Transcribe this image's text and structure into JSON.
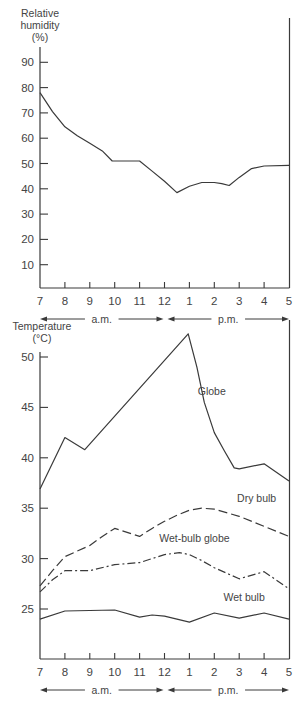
{
  "chart_data": [
    {
      "type": "line",
      "title": "",
      "ylabel": "Relative humidity (%)",
      "ylabel_lines": [
        "Relative",
        "humidity",
        "(%)"
      ],
      "xlabel": "",
      "ylim": [
        0,
        95
      ],
      "yticks": [
        10,
        20,
        30,
        40,
        50,
        60,
        70,
        80,
        90
      ],
      "x_tick_labels": [
        "7",
        "8",
        "9",
        "10",
        "11",
        "12",
        "1",
        "2",
        "3",
        "4",
        "5"
      ],
      "period_labels": [
        "a.m.",
        "p.m."
      ],
      "grid": false,
      "series": [
        {
          "name": "Relative humidity",
          "style": "solid",
          "x": [
            7,
            7.5,
            8,
            8.5,
            9,
            9.5,
            9.9,
            11,
            11.5,
            12,
            12.5,
            13,
            13.5,
            14,
            14.3,
            14.6,
            15,
            15.5,
            16,
            17
          ],
          "values": [
            78,
            70.5,
            64.5,
            61,
            58,
            55,
            51,
            51,
            47,
            43,
            38.5,
            41,
            42.5,
            42.5,
            42,
            41.3,
            44.5,
            48,
            49,
            49.3
          ]
        }
      ]
    },
    {
      "type": "line",
      "title": "",
      "ylabel": "Temperature (°C)",
      "ylabel_lines": [
        "Temperature",
        "(°C)"
      ],
      "xlabel": "",
      "ylim": [
        20,
        52.5
      ],
      "yticks": [
        25,
        30,
        35,
        40,
        45,
        50
      ],
      "x_tick_labels": [
        "7",
        "8",
        "9",
        "10",
        "11",
        "12",
        "1",
        "2",
        "3",
        "4",
        "5"
      ],
      "period_labels": [
        "a.m.",
        "p.m."
      ],
      "grid": false,
      "series": [
        {
          "name": "Globe",
          "style": "solid",
          "label_pos": {
            "x": 13.9,
            "y": 46.2
          },
          "x": [
            7,
            8,
            8.8,
            12.95,
            13.3,
            13.6,
            14,
            14.4,
            14.8,
            15,
            16,
            17
          ],
          "values": [
            36.9,
            42.0,
            40.8,
            52.3,
            49,
            45.5,
            42.5,
            40.7,
            39.0,
            38.9,
            39.4,
            37.7
          ]
        },
        {
          "name": "Dry bulb",
          "style": "dashed",
          "label_pos": {
            "x": 15.7,
            "y": 35.6
          },
          "x": [
            7,
            7.5,
            8,
            9,
            9.5,
            10,
            11,
            11.5,
            12,
            12.5,
            13,
            13.5,
            14,
            15,
            16,
            17
          ],
          "values": [
            27.3,
            28.8,
            30.2,
            31.3,
            32.2,
            33.0,
            32.2,
            33.0,
            33.7,
            34.3,
            34.8,
            35.0,
            34.9,
            34.2,
            33.2,
            32.2
          ],
          "marker": "none"
        },
        {
          "name": "Wet-bulb globe",
          "style": "dash-dot",
          "label_pos": {
            "x": 13.2,
            "y": 31.6
          },
          "x": [
            7,
            7.5,
            8,
            9,
            10,
            11,
            12,
            12.6,
            13,
            13.5,
            14,
            15,
            16,
            17
          ],
          "values": [
            26.7,
            27.9,
            28.8,
            28.8,
            29.4,
            29.6,
            30.4,
            30.6,
            30.4,
            29.8,
            29.1,
            28.0,
            28.7,
            27.0
          ]
        },
        {
          "name": "Wet bulb",
          "style": "solid",
          "label_pos": {
            "x": 15.2,
            "y": 25.8
          },
          "x": [
            7,
            8,
            10,
            11,
            11.5,
            12,
            13,
            14,
            15,
            16,
            17
          ],
          "values": [
            24.0,
            24.8,
            24.9,
            24.2,
            24.4,
            24.3,
            23.7,
            24.6,
            24.1,
            24.6,
            24.0
          ]
        }
      ]
    }
  ]
}
